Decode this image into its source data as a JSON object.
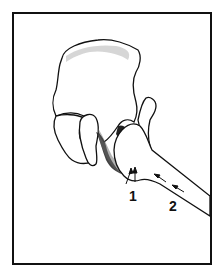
{
  "figure": {
    "labels": [
      {
        "id": "1",
        "text": "1",
        "x": 129,
        "y": 189
      },
      {
        "id": "2",
        "text": "2",
        "x": 169,
        "y": 199
      }
    ],
    "colors": {
      "line": "#111111",
      "shade": "#333333",
      "background": "#ffffff"
    }
  }
}
